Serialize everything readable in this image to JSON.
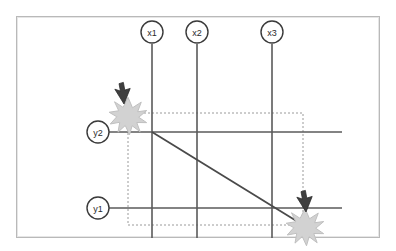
{
  "diagram": {
    "title": "",
    "frame": {
      "x": 16,
      "y": 16,
      "width": 364,
      "height": 222,
      "border_color": "#b9b9b9",
      "fill": "#ffffff"
    },
    "colors": {
      "axis_line": "#5a5a5a",
      "dashed_rect": "#9a9a9a",
      "diagonal_line": "#4a4a4a",
      "node_circle_stroke": "#3a3a3a",
      "node_circle_fill": "#ffffff",
      "label_text": "#2b2b2b",
      "burst_fill": "#d2d2d2",
      "burst_stroke": "#bdbdbd",
      "cursor_fill": "#3f3f3f"
    },
    "vertical_guides": [
      {
        "id": "x1",
        "label": "x1",
        "x": 152,
        "top": 44,
        "bottom": 238,
        "circle_cx": 152,
        "circle_cy": 32,
        "circle_r": 11
      },
      {
        "id": "x2",
        "label": "x2",
        "x": 197,
        "top": 44,
        "bottom": 238,
        "circle_cx": 197,
        "circle_cy": 32,
        "circle_r": 11
      },
      {
        "id": "x3",
        "label": "x3",
        "x": 272,
        "top": 44,
        "bottom": 238,
        "circle_cx": 272,
        "circle_cy": 32,
        "circle_r": 11
      }
    ],
    "horizontal_guides": [
      {
        "id": "y2",
        "label": "y2",
        "y": 132,
        "left": 109,
        "right": 342,
        "circle_cx": 98,
        "circle_cy": 132,
        "circle_r": 11
      },
      {
        "id": "y1",
        "label": "y1",
        "y": 208,
        "left": 109,
        "right": 342,
        "circle_cx": 98,
        "circle_cy": 208,
        "circle_r": 11
      }
    ],
    "dashed_rect": {
      "x": 128,
      "y": 113,
      "width": 175,
      "height": 112,
      "dash": "2 2"
    },
    "diagonal": {
      "x1": 152,
      "y1": 132,
      "x2": 303,
      "y2": 225
    },
    "click_markers": [
      {
        "id": "marker-start",
        "cx": 128,
        "cy": 116,
        "cursor_x": 124,
        "cursor_y": 104
      },
      {
        "id": "marker-end",
        "cx": 305,
        "cy": 227,
        "cursor_x": 305,
        "cursor_y": 212
      }
    ]
  }
}
